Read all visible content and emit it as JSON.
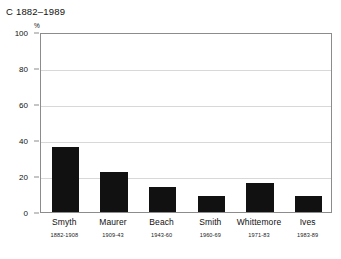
{
  "chart_data": {
    "type": "bar",
    "title": "C 1882–1989",
    "xlabel": "",
    "ylabel": "%",
    "ylim": [
      0,
      100
    ],
    "yticks": [
      0,
      20,
      40,
      60,
      80,
      100
    ],
    "grid": true,
    "legend": "none",
    "bar_color": "#111111",
    "categories": [
      "Smyth",
      "Maurer",
      "Beach",
      "Smith",
      "Whittemore",
      "Ives"
    ],
    "category_spans": [
      "1882-1908",
      "1909-43",
      "1943-60",
      "1960-69",
      "1971-83",
      "1983-89"
    ],
    "values": [
      36,
      22,
      14,
      9,
      16,
      9
    ]
  }
}
